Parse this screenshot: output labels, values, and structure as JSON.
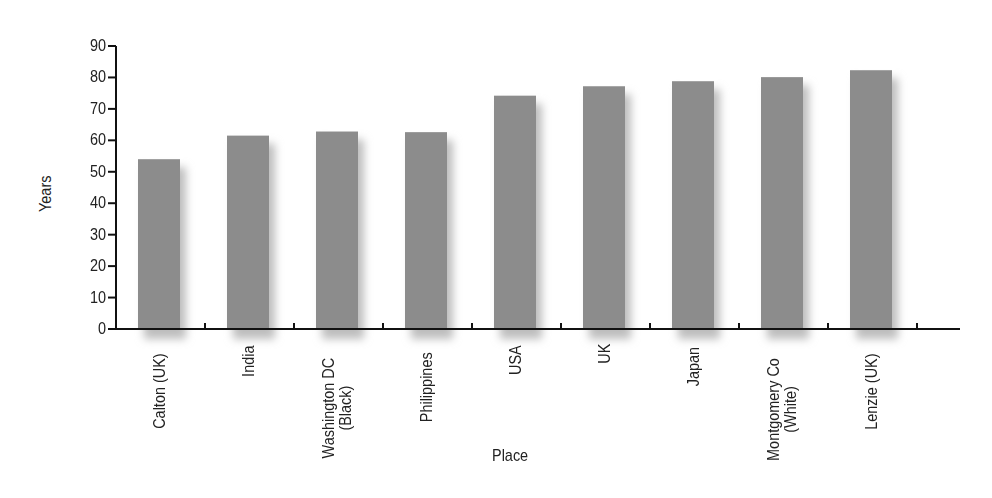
{
  "chart_data": {
    "type": "bar",
    "title": "",
    "xlabel": "Place",
    "ylabel": "Years",
    "ylim": [
      0,
      90
    ],
    "yticks": [
      0,
      10,
      20,
      30,
      40,
      50,
      60,
      70,
      80,
      90
    ],
    "grid": false,
    "legend": null,
    "categories": [
      "Calton (UK)",
      "India",
      "Washington DC (Black)",
      "Philippines",
      "USA",
      "UK",
      "Japan",
      "Montgomery Co (White)",
      "Lenzie (UK)"
    ],
    "category_lines": [
      [
        "Calton (UK)"
      ],
      [
        "India"
      ],
      [
        "Washington DC",
        "(Black)"
      ],
      [
        "Philippines"
      ],
      [
        "USA"
      ],
      [
        "UK"
      ],
      [
        "Japan"
      ],
      [
        "Montgomery Co",
        "(White)"
      ],
      [
        "Lenzie (UK)"
      ]
    ],
    "values": [
      54,
      61.5,
      62.8,
      62.6,
      74.2,
      77.2,
      78.8,
      80.1,
      82.3
    ],
    "bar_color": "#8c8c8c"
  }
}
